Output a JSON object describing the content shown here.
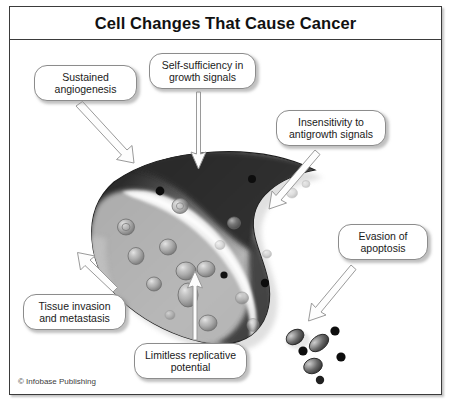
{
  "figure": {
    "title": "Cell Changes That Cause Cancer",
    "credit": "© Infobase Publishing",
    "border_color": "#3b3b3b",
    "background_color": "#ffffff"
  },
  "callouts": [
    {
      "id": "sustained-angiogenesis",
      "line1": "Sustained",
      "line2": "angiogenesis",
      "x": 24,
      "y": 25,
      "w": 103,
      "h": 36
    },
    {
      "id": "self-sufficiency-growth-signals",
      "line1": "Self-sufficiency in",
      "line2": "growth signals",
      "x": 139,
      "y": 13,
      "w": 107,
      "h": 36
    },
    {
      "id": "insensitivity-antigrowth-signals",
      "line1": "Insensitivity to",
      "line2": "antigrowth signals",
      "x": 266,
      "y": 70,
      "w": 110,
      "h": 36
    },
    {
      "id": "evasion-of-apoptosis",
      "line1": "Evasion of",
      "line2": "apoptosis",
      "x": 328,
      "y": 184,
      "w": 90,
      "h": 36
    },
    {
      "id": "tissue-invasion-metastasis",
      "line1": "Tissue invasion",
      "line2": "and metastasis",
      "x": 13,
      "y": 254,
      "w": 103,
      "h": 36
    },
    {
      "id": "limitless-replicative-potential",
      "line1": "Limitless replicative",
      "line2": "potential",
      "x": 124,
      "y": 303,
      "w": 113,
      "h": 36
    }
  ],
  "illustration": {
    "type": "cancer-cell-schematic",
    "cell_label": "cancer-cell-body",
    "vesicle_count": 18,
    "dark_granule_count": 4,
    "apoptotic_body_count": 4,
    "budding_cell_count": 3,
    "arrow_count": 6,
    "colors": {
      "cell_dark": "#2f2f2f",
      "cell_mid": "#8a8a8a",
      "cell_light": "#d9d9d9",
      "highlight": "#f2f2f2",
      "granule": "#111111",
      "arrow_stroke": "#8e8e8e",
      "arrow_fill": "#fdfdfd"
    }
  }
}
